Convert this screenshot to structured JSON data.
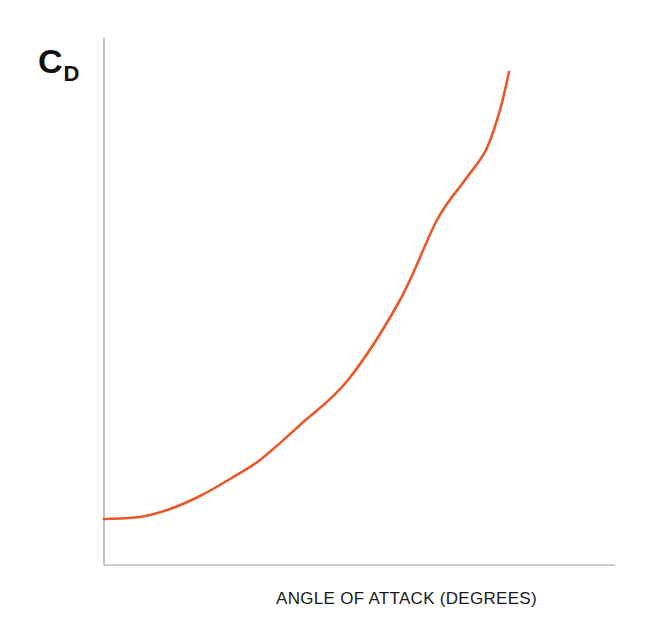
{
  "chart_data": {
    "type": "line",
    "title": "",
    "xlabel": "ANGLE OF ATTACK (DEGREES)",
    "ylabel": "C",
    "ylabel_subscript": "D",
    "grid": false,
    "legend": null,
    "ticks": {
      "x": [],
      "y": []
    },
    "series": [
      {
        "name": "Drag coefficient",
        "color": "#e8582a",
        "points_px": [
          [
            104,
            519
          ],
          [
            140,
            517
          ],
          [
            170,
            509
          ],
          [
            200,
            496
          ],
          [
            230,
            479
          ],
          [
            260,
            460
          ],
          [
            300,
            425
          ],
          [
            348,
            380
          ],
          [
            400,
            300
          ],
          [
            437,
            220
          ],
          [
            465,
            180
          ],
          [
            486,
            150
          ],
          [
            500,
            110
          ],
          [
            509,
            72
          ]
        ]
      }
    ],
    "axes": {
      "color": "#9a9aa8",
      "origin_px": [
        104,
        565
      ],
      "x_end_px": 615,
      "y_top_px": 38
    }
  }
}
